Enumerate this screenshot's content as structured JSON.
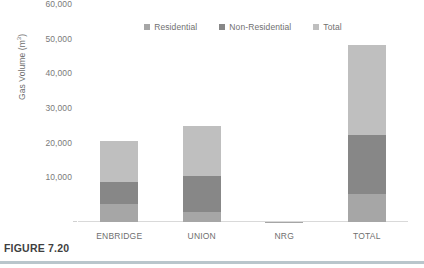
{
  "figure": {
    "caption": "FIGURE 7.20",
    "rule_color": "#b9c6cc"
  },
  "chart_data": {
    "type": "bar",
    "subtype": "stacked-bar",
    "title": "",
    "xlabel": "",
    "ylabel": "Gas Volume (m³)",
    "ylabel_text": "Gas Volume (m",
    "ylabel_sup": "3",
    "ylabel_close": ")",
    "categories": [
      "ENBRIDGE",
      "UNION",
      "NRG",
      "TOTAL"
    ],
    "series": [
      {
        "name": "Residential",
        "color": "#a6a6a6",
        "values": [
          5300,
          2800,
          60,
          8100
        ]
      },
      {
        "name": "Non-Residential",
        "color": "#878787",
        "values": [
          6300,
          10500,
          40,
          17100
        ]
      },
      {
        "name": "Total",
        "color": "#bfbfbf",
        "values": [
          11700,
          14300,
          30,
          25800
        ]
      }
    ],
    "stack_totals": [
      23300,
      27600,
      130,
      51000
    ],
    "ylim": [
      0,
      60000
    ],
    "yticks": [
      0,
      10000,
      20000,
      30000,
      40000,
      50000,
      60000
    ],
    "ytick_labels": [
      "",
      "10,000",
      "20,000",
      "30,000",
      "40,000",
      "50,000",
      "60,000"
    ],
    "grid": false,
    "legend_position": "top-center",
    "axis_color": "#d9d9d9",
    "tick_label_color": "#7a7a7a"
  }
}
